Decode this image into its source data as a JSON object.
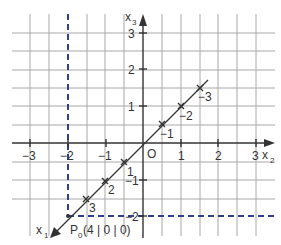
{
  "diagram": {
    "type": "3d-coordinate-system-oblique",
    "colors": {
      "grid": "#a8a8a8",
      "axis": "#333333",
      "projection": "#2e3f8f",
      "background": "#ffffff"
    },
    "axes": {
      "x2": {
        "label": "x",
        "subscript": "2",
        "ticks": [
          "−3",
          "−2",
          "−1",
          "1",
          "2",
          "3"
        ]
      },
      "x3": {
        "label": "x",
        "subscript": "3",
        "ticks": [
          "3",
          "2",
          "1",
          "−1",
          "−2"
        ]
      },
      "x1": {
        "label": "x",
        "subscript": "1",
        "ticks_positive": [
          "1",
          "2",
          "3"
        ],
        "ticks_negative": [
          "−1",
          "−2",
          "−3"
        ]
      }
    },
    "origin_label": "O",
    "point": {
      "name": "P",
      "subscript": "0",
      "coords_text": "(4 | 0 | 0)"
    }
  }
}
